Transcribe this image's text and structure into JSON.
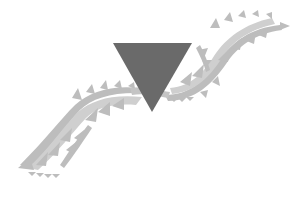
{
  "graphic": {
    "description": "Decorative emblem: dark inverted triangle over a wavy tribal band",
    "colors": {
      "background": "#ffffff",
      "triangle": "#6a6a6a",
      "band": "#bdbdbd",
      "band_light": "#d6d6d6"
    },
    "icons": [
      "inverted-triangle-icon",
      "tribal-wave-band"
    ]
  }
}
